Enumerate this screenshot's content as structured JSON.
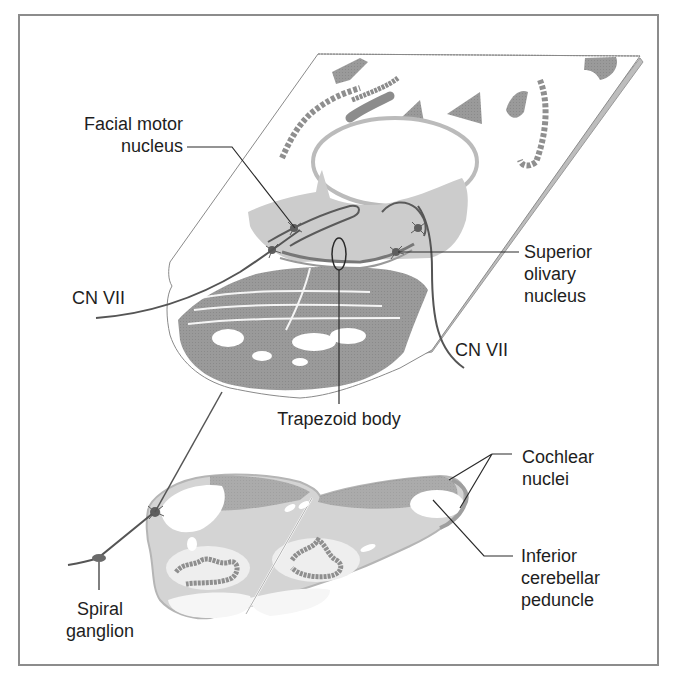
{
  "figure": {
    "type": "anatomical diagram",
    "colors": {
      "frame": "#8c8c8c",
      "gray_matter_dark": "#8f8f8f",
      "gray_matter_mid": "#a9a9a9",
      "gray_light": "#cfcfcf",
      "nerve_line": "#555555",
      "leader_line": "#2a2a2a"
    }
  },
  "labels": {
    "facial_motor_nucleus": {
      "line1": "Facial motor",
      "line2": "nucleus"
    },
    "superior_olivary_nucleus": {
      "line1": "Superior",
      "line2": "olivary",
      "line3": "nucleus"
    },
    "cn_vii_left": {
      "text": "CN VII"
    },
    "cn_vii_right": {
      "text": "CN VII"
    },
    "trapezoid_body": {
      "text": "Trapezoid body"
    },
    "cochlear_nuclei": {
      "line1": "Cochlear",
      "line2": "nuclei"
    },
    "inferior_cerebellar_peduncle": {
      "line1": "Inferior",
      "line2": "cerebellar",
      "line3": "peduncle"
    },
    "spiral_ganglion": {
      "line1": "Spiral",
      "line2": "ganglion"
    }
  }
}
